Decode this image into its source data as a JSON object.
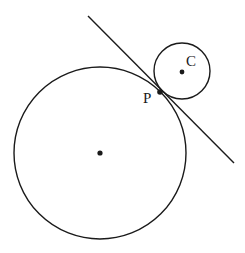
{
  "diagram": {
    "large_circle": {
      "cx": 100,
      "cy": 153,
      "r": 86,
      "center_dot": true
    },
    "small_circle": {
      "cx": 182,
      "cy": 71,
      "r": 28,
      "center_dot": true,
      "center_label": "C"
    },
    "tangent_point": {
      "x": 160,
      "y": 92,
      "label": "P"
    },
    "tangent_line": {
      "x1": 88,
      "y1": 16,
      "x2": 234,
      "y2": 163
    },
    "labels": {
      "c": "C",
      "p": "P"
    },
    "colors": {
      "stroke": "#1a1a1a",
      "background": "#ffffff"
    }
  }
}
